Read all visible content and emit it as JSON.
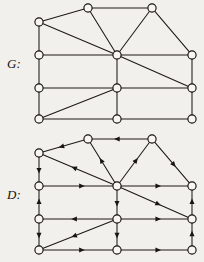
{
  "figure": {
    "background_color": "#f2f0ec",
    "ink_color": "#15120f",
    "vertex_fill": "#f7f6f3",
    "width": 204,
    "height": 262
  },
  "graphs": [
    {
      "id": "G",
      "label": "G:",
      "label_position": {
        "x": 7,
        "y": 56
      },
      "type": "undirected",
      "vertex_radius": 4.1,
      "vertices": [
        {
          "id": "t1",
          "name": "top-left-apex",
          "x": 88,
          "y": 8
        },
        {
          "id": "t2",
          "name": "top-right-apex",
          "x": 152,
          "y": 8
        },
        {
          "id": "l1",
          "name": "left-upper",
          "x": 39,
          "y": 22
        },
        {
          "id": "l2",
          "name": "left-mid-upper",
          "x": 39,
          "y": 55
        },
        {
          "id": "l3",
          "name": "left-mid-lower",
          "x": 39,
          "y": 88
        },
        {
          "id": "l4",
          "name": "left-lower",
          "x": 39,
          "y": 119
        },
        {
          "id": "c1",
          "name": "center-hub",
          "x": 117,
          "y": 55
        },
        {
          "id": "c2",
          "name": "center-mid",
          "x": 117,
          "y": 88
        },
        {
          "id": "c3",
          "name": "center-lower",
          "x": 117,
          "y": 119
        },
        {
          "id": "r1",
          "name": "right-upper",
          "x": 192,
          "y": 55
        },
        {
          "id": "r2",
          "name": "right-mid",
          "x": 192,
          "y": 88
        },
        {
          "id": "r3",
          "name": "right-lower",
          "x": 192,
          "y": 119
        }
      ],
      "edges": [
        {
          "from": "l1",
          "to": "t1"
        },
        {
          "from": "t1",
          "to": "t2"
        },
        {
          "from": "t1",
          "to": "c1"
        },
        {
          "from": "t2",
          "to": "c1"
        },
        {
          "from": "t2",
          "to": "r1"
        },
        {
          "from": "l1",
          "to": "l2"
        },
        {
          "from": "l1",
          "to": "c1"
        },
        {
          "from": "l2",
          "to": "c1"
        },
        {
          "from": "l2",
          "to": "l3"
        },
        {
          "from": "c1",
          "to": "r1"
        },
        {
          "from": "c1",
          "to": "c2"
        },
        {
          "from": "c1",
          "to": "r2"
        },
        {
          "from": "r1",
          "to": "r2"
        },
        {
          "from": "l3",
          "to": "c2"
        },
        {
          "from": "l3",
          "to": "l4"
        },
        {
          "from": "c2",
          "to": "r2"
        },
        {
          "from": "c2",
          "to": "c3"
        },
        {
          "from": "c2",
          "to": "l4"
        },
        {
          "from": "r2",
          "to": "r3"
        },
        {
          "from": "l4",
          "to": "c3"
        },
        {
          "from": "c3",
          "to": "r3"
        }
      ]
    },
    {
      "id": "D",
      "label": "D:",
      "label_position": {
        "x": 7,
        "y": 187
      },
      "type": "directed",
      "vertex_radius": 4.1,
      "vertices": [
        {
          "id": "t1",
          "name": "top-left-apex",
          "x": 88,
          "y": 139
        },
        {
          "id": "t2",
          "name": "top-right-apex",
          "x": 152,
          "y": 139
        },
        {
          "id": "l1",
          "name": "left-upper",
          "x": 39,
          "y": 153
        },
        {
          "id": "l2",
          "name": "left-mid-upper",
          "x": 39,
          "y": 186
        },
        {
          "id": "l3",
          "name": "left-mid-lower",
          "x": 39,
          "y": 219
        },
        {
          "id": "l4",
          "name": "left-lower",
          "x": 39,
          "y": 250
        },
        {
          "id": "c1",
          "name": "center-hub",
          "x": 117,
          "y": 186
        },
        {
          "id": "c2",
          "name": "center-mid",
          "x": 117,
          "y": 219
        },
        {
          "id": "c3",
          "name": "center-lower",
          "x": 117,
          "y": 250
        },
        {
          "id": "r1",
          "name": "right-upper",
          "x": 192,
          "y": 186
        },
        {
          "id": "r2",
          "name": "right-mid",
          "x": 192,
          "y": 219
        },
        {
          "id": "r3",
          "name": "right-lower",
          "x": 192,
          "y": 250
        }
      ],
      "edges": [
        {
          "from": "t1",
          "to": "l1",
          "arrow": "mid"
        },
        {
          "from": "t2",
          "to": "t1",
          "arrow": "mid"
        },
        {
          "from": "c1",
          "to": "t1",
          "arrow": "mid"
        },
        {
          "from": "c1",
          "to": "t2",
          "arrow": "mid"
        },
        {
          "from": "t2",
          "to": "r1",
          "arrow": "mid"
        },
        {
          "from": "l1",
          "to": "l2",
          "arrow": "mid"
        },
        {
          "from": "c1",
          "to": "l1",
          "arrow": "mid"
        },
        {
          "from": "l2",
          "to": "c1",
          "arrow": "mid"
        },
        {
          "from": "l3",
          "to": "l2",
          "arrow": "mid"
        },
        {
          "from": "c1",
          "to": "r1",
          "arrow": "mid"
        },
        {
          "from": "c1",
          "to": "c2",
          "arrow": "mid"
        },
        {
          "from": "c1",
          "to": "r2",
          "arrow": "mid"
        },
        {
          "from": "r2",
          "to": "r1",
          "arrow": "mid"
        },
        {
          "from": "c2",
          "to": "l3",
          "arrow": "mid"
        },
        {
          "from": "l3",
          "to": "l4",
          "arrow": "mid"
        },
        {
          "from": "c2",
          "to": "r2",
          "arrow": "mid"
        },
        {
          "from": "c2",
          "to": "c3",
          "arrow": "mid"
        },
        {
          "from": "c2",
          "to": "l4",
          "arrow": "mid"
        },
        {
          "from": "r3",
          "to": "r2",
          "arrow": "mid"
        },
        {
          "from": "l4",
          "to": "c3",
          "arrow": "mid"
        },
        {
          "from": "c3",
          "to": "r3",
          "arrow": "mid"
        }
      ]
    }
  ]
}
